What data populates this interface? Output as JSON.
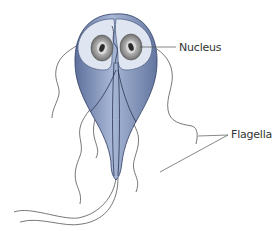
{
  "diagram": {
    "labels": {
      "nucleus": "Nucleus",
      "flagella": "Flagella"
    },
    "colors": {
      "body_dark": "#5a6f9c",
      "body_light": "#a9b8d8",
      "disc": "#dfe6f1",
      "nucleus_ring": "#8a8a8a",
      "nucleus_core": "#2b2b2b",
      "flagella_line": "#555555",
      "leader_line": "#555555"
    }
  }
}
